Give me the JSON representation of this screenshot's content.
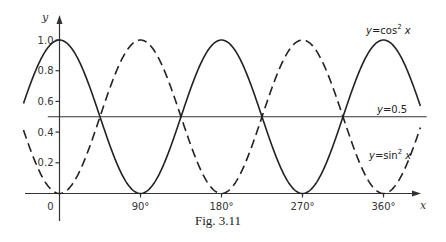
{
  "figure": {
    "caption": "Fig. 3.11"
  },
  "chart_data": {
    "type": "line",
    "title": "",
    "caption": "Fig. 3.11",
    "xlabel": "x",
    "ylabel": "y",
    "x_unit": "degrees",
    "xlim": [
      -40,
      401
    ],
    "ylim": [
      0,
      1.0
    ],
    "x_ticks": [
      {
        "value": 0,
        "label": "0"
      },
      {
        "value": 90,
        "label": "90°"
      },
      {
        "value": 180,
        "label": "180°"
      },
      {
        "value": 270,
        "label": "270°"
      },
      {
        "value": 360,
        "label": "360°"
      }
    ],
    "y_ticks": [
      {
        "value": 0.2,
        "label": "0.2"
      },
      {
        "value": 0.4,
        "label": "0.4"
      },
      {
        "value": 0.6,
        "label": "0.6"
      },
      {
        "value": 0.8,
        "label": "0.8"
      },
      {
        "value": 1.0,
        "label": "1.0"
      }
    ],
    "grid": false,
    "legend": null,
    "series": [
      {
        "name": "y = cos² x",
        "function": "cos2",
        "style": "solid",
        "label_text": "y=cos² x",
        "x": [
          -40,
          0,
          45,
          90,
          135,
          180,
          225,
          270,
          315,
          360,
          401
        ],
        "values": [
          0.587,
          1.0,
          0.5,
          0.0,
          0.5,
          1.0,
          0.5,
          0.0,
          0.5,
          1.0,
          0.569
        ]
      },
      {
        "name": "y = sin² x",
        "function": "sin2",
        "style": "dashed",
        "label_text": "y=sin² x",
        "x": [
          -40,
          0,
          45,
          90,
          135,
          180,
          225,
          270,
          315,
          360,
          401
        ],
        "values": [
          0.413,
          0.0,
          0.5,
          1.0,
          0.5,
          0.0,
          0.5,
          1.0,
          0.5,
          0.0,
          0.431
        ]
      },
      {
        "name": "y = 0.5",
        "function": "const",
        "constant": 0.5,
        "style": "solid",
        "label_text": "y=0.5",
        "x": [
          -13,
          408
        ],
        "values": [
          0.5,
          0.5
        ]
      }
    ],
    "annotations": [
      {
        "text": "y=cos² x",
        "near_x": 360,
        "near_y": 1.05
      },
      {
        "text": "y=0.5",
        "near_x": 360,
        "near_y": 0.52
      },
      {
        "text": "y=sin² x",
        "near_x": 340,
        "near_y": 0.23
      }
    ]
  },
  "labels": {
    "y_axis": "y",
    "x_axis": "x",
    "origin": "0",
    "cos_label_y": "y",
    "cos_label_rest": "=cos",
    "cos_label_x": " x",
    "sin_label_y": "y",
    "sin_label_rest": "=sin",
    "sin_label_x": " x",
    "half_label_y": "y",
    "half_label_rest": "=0.5",
    "superscript": "2"
  }
}
